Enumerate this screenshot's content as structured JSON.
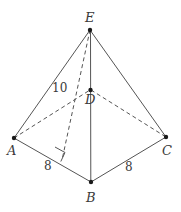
{
  "figure": {
    "type": "geometry-diagram",
    "canvas": {
      "width": 181,
      "height": 212
    },
    "colors": {
      "background": "#ffffff",
      "stroke": "#555555",
      "dashed_stroke": "#555555",
      "vertex_dot": "#1a1a1a",
      "label_text": "#3a3a3a"
    },
    "vertices": [
      {
        "name": "E",
        "label": "E",
        "x": 90,
        "y": 30,
        "label_x": 85,
        "label_y": 12,
        "role": "apex"
      },
      {
        "name": "A",
        "label": "A",
        "x": 14,
        "y": 138,
        "label_x": 8,
        "label_y": 145,
        "role": "base-front-left"
      },
      {
        "name": "B",
        "label": "B",
        "x": 91,
        "y": 182,
        "label_x": 86,
        "label_y": 192,
        "role": "base-front"
      },
      {
        "name": "C",
        "label": "C",
        "x": 166,
        "y": 137,
        "label_x": 163,
        "label_y": 145,
        "role": "base-front-right"
      },
      {
        "name": "D",
        "label": "D",
        "x": 91,
        "y": 90,
        "label_x": 86,
        "label_y": 93,
        "role": "base-back"
      }
    ],
    "solid_edges": [
      {
        "name": "edge-EA",
        "from": "E",
        "to": "A"
      },
      {
        "name": "edge-EB",
        "from": "E",
        "to": "B"
      },
      {
        "name": "edge-EC",
        "from": "E",
        "to": "C"
      },
      {
        "name": "edge-ED-DB-vertical",
        "from": "E",
        "to": "B"
      },
      {
        "name": "edge-AB",
        "from": "A",
        "to": "B"
      },
      {
        "name": "edge-BC",
        "from": "B",
        "to": "C"
      }
    ],
    "dashed_edges": [
      {
        "name": "edge-AD-hidden",
        "from": "A",
        "to": "D"
      },
      {
        "name": "edge-DC-hidden",
        "from": "D",
        "to": "C"
      },
      {
        "name": "altitude-E-to-AB",
        "from_x": 90,
        "from_y": 30,
        "to_x": 62,
        "to_y": 160
      }
    ],
    "right_angle": {
      "name": "right-angle-marker",
      "foot_x": 62,
      "foot_y": 160,
      "points": "55,147 65,152 61,161"
    },
    "measures": [
      {
        "name": "slant-height-label",
        "text": "10",
        "x": 52,
        "y": 82,
        "edge": "EA"
      },
      {
        "name": "base-edge-ab-label",
        "text": "8",
        "x": 44,
        "y": 161,
        "edge": "AB"
      },
      {
        "name": "base-edge-bc-label",
        "text": "8",
        "x": 125,
        "y": 162,
        "edge": "BC"
      }
    ]
  }
}
